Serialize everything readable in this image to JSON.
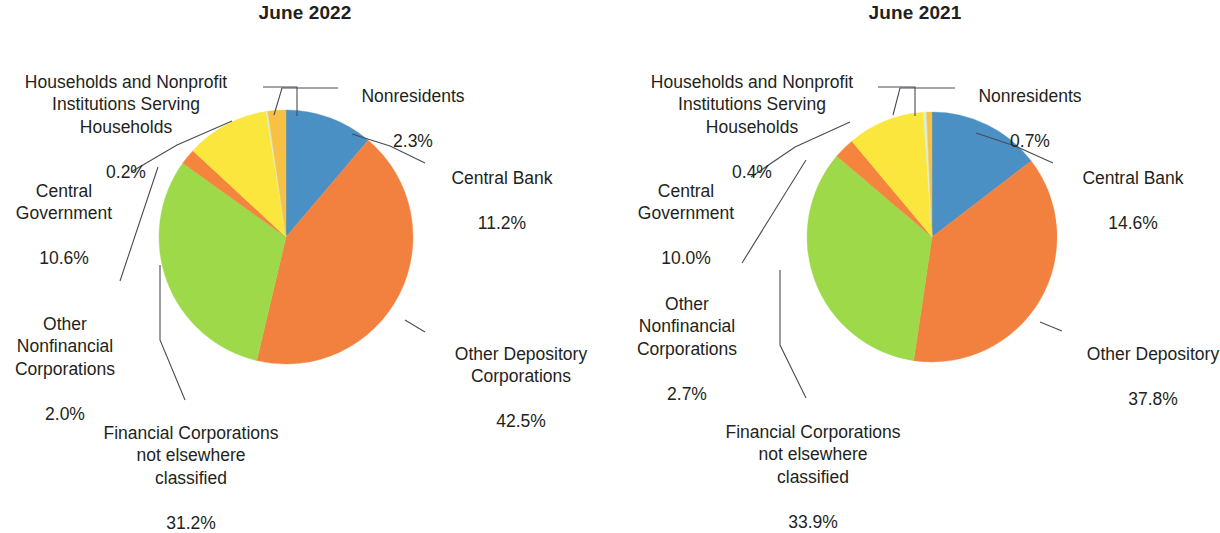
{
  "colors": {
    "central_bank": "#4a90c4",
    "other_depository": "#f2813f",
    "financial_nec": "#9ed94a",
    "other_nonfinancial": "#f5843c",
    "central_government": "#fae63c",
    "households": "#d8efdc",
    "nonresidents": "#f7c244",
    "text": "#231f20",
    "leader": "#4b4b55",
    "background": "#ffffff"
  },
  "chart_data": [
    {
      "type": "pie",
      "title": "June 2022",
      "labels": [
        "Central Bank",
        "Other Depository Corporations",
        "Financial Corporations not elsewhere classified",
        "Other Nonfinancial Corporations",
        "Central Government",
        "Households and Nonprofit Institutions Serving Households",
        "Nonresidents"
      ],
      "values": [
        11.2,
        42.5,
        31.2,
        2.0,
        10.6,
        0.2,
        2.3
      ],
      "value_labels": [
        "11.2%",
        "42.5%",
        "31.2%",
        "2.0%",
        "10.6%",
        "0.2%",
        "2.3%"
      ],
      "colors": [
        "#4a90c4",
        "#f2813f",
        "#9ed94a",
        "#f5843c",
        "#fae63c",
        "#d8efdc",
        "#f7c244"
      ],
      "start_angle": 0,
      "direction": "clockwise",
      "legend": "none",
      "callouts": [
        {
          "name": "households",
          "title": "Households and Nonprofit\nInstitutions Serving\nHouseholds",
          "value": "0.2%"
        },
        {
          "name": "central-government",
          "title": "Central\nGovernment",
          "value": "10.6%"
        },
        {
          "name": "other-nonfinancial",
          "title": "Other\nNonfinancial\nCorporations",
          "value": "2.0%"
        },
        {
          "name": "financial-nec",
          "title": "Financial Corporations\nnot elsewhere\nclassified",
          "value": "31.2%"
        },
        {
          "name": "other-depository",
          "title": "Other Depository\nCorporations",
          "value": "42.5%"
        },
        {
          "name": "central-bank",
          "title": "Central Bank",
          "value": "11.2%"
        },
        {
          "name": "nonresidents",
          "title": "Nonresidents",
          "value": "2.3%"
        }
      ]
    },
    {
      "type": "pie",
      "title": "June 2021",
      "labels": [
        "Central Bank",
        "Other Depository",
        "Financial Corporations not elsewhere classified",
        "Other Nonfinancial Corporations",
        "Central Government",
        "Households and Nonprofit Institutions Serving Households",
        "Nonresidents"
      ],
      "values": [
        14.6,
        37.8,
        33.9,
        2.7,
        10.0,
        0.4,
        0.7
      ],
      "value_labels": [
        "14.6%",
        "37.8%",
        "33.9%",
        "2.7%",
        "10.0%",
        "0.4%",
        "0.7%"
      ],
      "colors": [
        "#4a90c4",
        "#f2813f",
        "#9ed94a",
        "#f5843c",
        "#fae63c",
        "#d8efdc",
        "#f7c244"
      ],
      "start_angle": 0,
      "direction": "clockwise",
      "legend": "none",
      "callouts": [
        {
          "name": "households",
          "title": "Households and Nonprofit\nInstitutions Serving\nHouseholds",
          "value": "0.4%"
        },
        {
          "name": "central-government",
          "title": "Central\nGovernment",
          "value": "10.0%"
        },
        {
          "name": "other-nonfinancial",
          "title": "Other\nNonfinancial\nCorporations",
          "value": "2.7%"
        },
        {
          "name": "financial-nec",
          "title": "Financial Corporations\nnot elsewhere\nclassified",
          "value": "33.9%"
        },
        {
          "name": "other-depository",
          "title": "Other Depository",
          "value": "37.8%"
        },
        {
          "name": "central-bank",
          "title": "Central Bank",
          "value": "14.6%"
        },
        {
          "name": "nonresidents",
          "title": "Nonresidents",
          "value": "0.7%"
        }
      ]
    }
  ]
}
